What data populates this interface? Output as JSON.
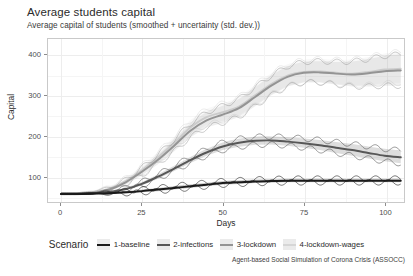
{
  "title": "Average students capital",
  "subtitle": "Average capital of students (smoothed + uncertainty (std. dev.))",
  "caption": "Agent-based Social Simulation of Corona Crisis (ASSOCC)",
  "legend": {
    "title": "Scenario",
    "items": [
      {
        "label": "1-baseline",
        "color": "#1a1a1a"
      },
      {
        "label": "2-infections",
        "color": "#575757"
      },
      {
        "label": "3-lockdown",
        "color": "#949494"
      },
      {
        "label": "4-lockdown-wages",
        "color": "#d6d6d6"
      }
    ]
  },
  "chart_data": {
    "type": "line",
    "title": "Average students capital",
    "subtitle": "Average capital of students (smoothed + uncertainty (std. dev.))",
    "xlabel": "Days",
    "ylabel": "Capital",
    "xlim": [
      -4,
      106
    ],
    "ylim": [
      35,
      440
    ],
    "xticks": [
      0,
      25,
      50,
      75,
      100
    ],
    "yticks": [
      100,
      200,
      300,
      400
    ],
    "grid": true,
    "legend_position": "bottom",
    "uncertainty": "ribbon + std. dev. bands (smoothed)",
    "x": [
      0,
      5,
      10,
      15,
      20,
      25,
      30,
      35,
      40,
      45,
      50,
      55,
      60,
      65,
      70,
      75,
      80,
      85,
      90,
      95,
      100,
      105
    ],
    "series": [
      {
        "name": "1-baseline",
        "color": "#1a1a1a",
        "values": [
          55,
          55,
          56,
          57,
          59,
          62,
          66,
          70,
          74,
          78,
          82,
          84,
          86,
          87,
          88,
          88,
          88,
          88,
          88,
          88,
          88,
          88
        ],
        "band_low": [
          54,
          54,
          54,
          55,
          56,
          59,
          62,
          66,
          70,
          74,
          78,
          80,
          82,
          83,
          84,
          84,
          84,
          84,
          84,
          84,
          84,
          84
        ],
        "band_high": [
          57,
          57,
          58,
          60,
          63,
          66,
          70,
          75,
          79,
          83,
          87,
          89,
          91,
          92,
          93,
          93,
          93,
          93,
          93,
          93,
          93,
          93
        ]
      },
      {
        "name": "2-infections",
        "color": "#575757",
        "values": [
          55,
          55,
          57,
          60,
          67,
          80,
          98,
          118,
          139,
          158,
          173,
          182,
          187,
          188,
          185,
          181,
          176,
          170,
          164,
          157,
          150,
          146
        ],
        "band_low": [
          54,
          54,
          55,
          58,
          64,
          76,
          93,
          112,
          132,
          150,
          164,
          172,
          177,
          178,
          175,
          170,
          164,
          157,
          150,
          143,
          136,
          131
        ],
        "band_high": [
          57,
          57,
          59,
          63,
          71,
          85,
          104,
          125,
          147,
          167,
          183,
          192,
          197,
          198,
          196,
          193,
          189,
          184,
          179,
          173,
          167,
          163
        ]
      },
      {
        "name": "3-lockdown",
        "color": "#949494",
        "values": [
          55,
          55,
          58,
          66,
          84,
          110,
          140,
          175,
          212,
          238,
          252,
          268,
          296,
          324,
          346,
          356,
          357,
          354,
          352,
          355,
          360,
          362
        ],
        "band_low": [
          53,
          53,
          55,
          62,
          78,
          101,
          129,
          161,
          196,
          220,
          232,
          246,
          273,
          300,
          322,
          332,
          332,
          327,
          322,
          322,
          324,
          324
        ],
        "band_high": [
          58,
          58,
          62,
          71,
          91,
          120,
          153,
          190,
          230,
          258,
          274,
          291,
          320,
          349,
          372,
          383,
          385,
          383,
          384,
          390,
          398,
          402
        ]
      },
      {
        "name": "4-lockdown-wages",
        "color": "#d6d6d6",
        "values": [
          55,
          55,
          59,
          68,
          87,
          114,
          146,
          182,
          220,
          246,
          258,
          272,
          300,
          328,
          349,
          358,
          359,
          356,
          354,
          358,
          364,
          366
        ],
        "band_low": [
          53,
          53,
          56,
          63,
          80,
          104,
          134,
          167,
          203,
          227,
          237,
          250,
          276,
          303,
          324,
          333,
          333,
          329,
          325,
          326,
          330,
          331
        ],
        "band_high": [
          58,
          58,
          63,
          74,
          95,
          125,
          159,
          197,
          238,
          266,
          280,
          296,
          326,
          355,
          377,
          388,
          390,
          388,
          389,
          395,
          404,
          408
        ]
      }
    ]
  }
}
